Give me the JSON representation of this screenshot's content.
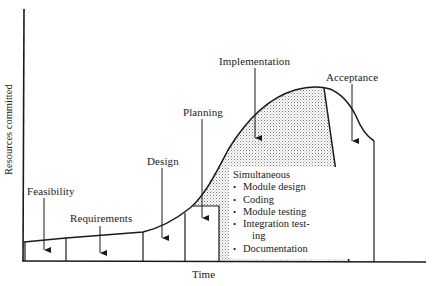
{
  "diagram": {
    "type": "resource-commitment curve over software life cycle",
    "axes": {
      "y_label": "Resources committed",
      "x_label": "Time"
    },
    "phases": [
      {
        "label": "Feasibility"
      },
      {
        "label": "Requirements"
      },
      {
        "label": "Design"
      },
      {
        "label": "Planning"
      },
      {
        "label": "Implementation"
      },
      {
        "label": "Acceptance"
      }
    ],
    "simultaneous_box": {
      "title": "Simultaneous",
      "items": [
        {
          "text": "Module design"
        },
        {
          "text": "Coding"
        },
        {
          "text": "Module testing"
        },
        {
          "text": "Integration test-",
          "continuation": "ing"
        },
        {
          "text": "Documentation"
        }
      ]
    },
    "colors": {
      "ink": "#1a1a1a",
      "stipple": "#8a8a8a",
      "background": "#ffffff"
    }
  }
}
